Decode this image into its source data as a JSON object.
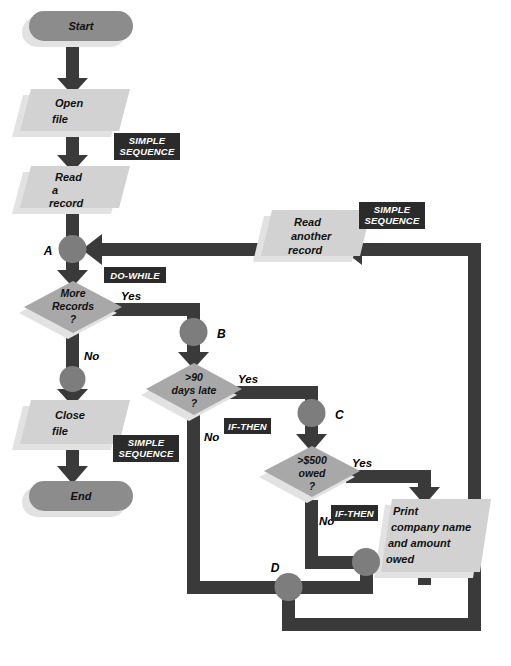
{
  "diagram": {
    "palette": {
      "page_background": "#ffffff",
      "flowline": "#3a3a3a",
      "terminator_fill": "#8c8c8c",
      "process_fill": "#d2d2d2",
      "decision_fill": "#a8a8a8",
      "shadow_fill": "#e2e2e2",
      "connector_fill": "#7d7d7d",
      "tag_background": "#2b2b2b",
      "tag_text": "#ffffff",
      "text": "#111111"
    },
    "nodes": [
      {
        "id": "start",
        "type": "terminator",
        "label": "Start",
        "lines": [
          "Start"
        ]
      },
      {
        "id": "open-file",
        "type": "io",
        "label": "Open file",
        "lines": [
          "Open",
          "file"
        ]
      },
      {
        "id": "read-record",
        "type": "io",
        "label": "Read a record",
        "lines": [
          "Read",
          "a",
          "record"
        ]
      },
      {
        "id": "more-records",
        "type": "decision",
        "label": "More Records ?",
        "lines": [
          "More",
          "Records",
          "?"
        ]
      },
      {
        "id": "close-file",
        "type": "io",
        "label": "Close file",
        "lines": [
          "Close",
          "file"
        ]
      },
      {
        "id": "end",
        "type": "terminator",
        "label": "End",
        "lines": [
          "End"
        ]
      },
      {
        "id": "days-late",
        "type": "decision",
        "label": ">90 days late ?",
        "lines": [
          ">90",
          "days late",
          "?"
        ]
      },
      {
        "id": "owed",
        "type": "decision",
        "label": ">$500 owed ?",
        "lines": [
          ">$500",
          "owed",
          "?"
        ]
      },
      {
        "id": "print",
        "type": "io",
        "label": "Print company name and amount owed",
        "lines": [
          "Print",
          "company name",
          "and amount",
          "owed"
        ]
      },
      {
        "id": "read-another",
        "type": "io",
        "label": "Read another record",
        "lines": [
          "Read",
          "another",
          "record"
        ]
      }
    ],
    "connectors": [
      {
        "id": "conn-a",
        "letter": "A"
      },
      {
        "id": "conn-b",
        "letter": "B"
      },
      {
        "id": "conn-c",
        "letter": "C"
      },
      {
        "id": "conn-d",
        "letter": "D"
      },
      {
        "id": "conn-no-more",
        "letter": ""
      },
      {
        "id": "conn-print-join",
        "letter": ""
      }
    ],
    "branch_labels": [
      {
        "id": "more-records-yes",
        "text": "Yes"
      },
      {
        "id": "more-records-no",
        "text": "No"
      },
      {
        "id": "days-late-yes",
        "text": "Yes"
      },
      {
        "id": "days-late-no",
        "text": "No"
      },
      {
        "id": "owed-yes",
        "text": "Yes"
      },
      {
        "id": "owed-no",
        "text": "No"
      }
    ],
    "structure_tags": [
      {
        "id": "tag-simple-sequence-1",
        "lines": [
          "SIMPLE",
          "SEQUENCE"
        ]
      },
      {
        "id": "tag-do-while",
        "lines": [
          "DO-WHILE"
        ]
      },
      {
        "id": "tag-simple-sequence-2",
        "lines": [
          "SIMPLE",
          "SEQUENCE"
        ]
      },
      {
        "id": "tag-if-then-1",
        "lines": [
          "IF-THEN"
        ]
      },
      {
        "id": "tag-if-then-2",
        "lines": [
          "IF-THEN"
        ]
      },
      {
        "id": "tag-simple-sequence-3",
        "lines": [
          "SIMPLE",
          "SEQUENCE"
        ]
      }
    ]
  }
}
